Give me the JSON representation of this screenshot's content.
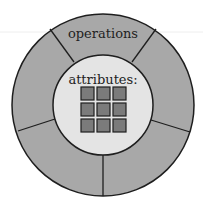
{
  "diagram": {
    "type": "object-encapsulation",
    "outer_ring": {
      "label": "operations",
      "segments": 5,
      "fill": "#a8a8a8"
    },
    "core": {
      "label": "attributes:",
      "fill": "#e4e4e4",
      "grid": {
        "rows": 3,
        "cols": 3,
        "cell_fill": "#7b7b7b"
      }
    },
    "stroke": "#1e1e1e"
  }
}
